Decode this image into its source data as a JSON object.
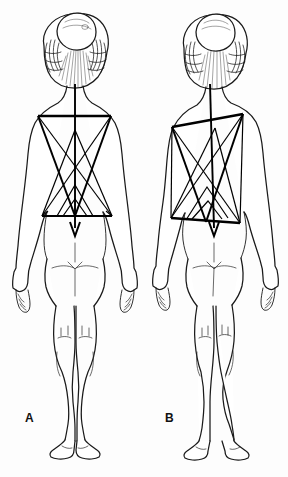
{
  "figure": {
    "background_color": "#fdfdfd",
    "ink_color": "#1a1a1a",
    "overlay_color": "#000000",
    "width": 288,
    "height": 477
  },
  "panels": [
    {
      "id": "A",
      "label": "A",
      "label_x": 25,
      "label_y": 411,
      "description": "Posterior view of female figure with symmetric postural grid overlay",
      "posture": "balanced",
      "figure_center_x": 75,
      "overlay": {
        "type": "symmetric",
        "shoulder_line": {
          "x1": 38,
          "y1": 116,
          "x2": 111,
          "y2": 116
        },
        "pelvic_line": {
          "x1": 42,
          "y1": 216,
          "x2": 112,
          "y2": 216
        },
        "plumb_line": {
          "x1": 75,
          "y1": 84,
          "x2": 75,
          "y2": 243
        },
        "upper_triangle": [
          [
            38,
            116
          ],
          [
            111,
            116
          ],
          [
            75,
            216
          ]
        ],
        "lower_triangle": [
          [
            42,
            216
          ],
          [
            112,
            216
          ],
          [
            75,
            116
          ]
        ],
        "diagonals": [
          {
            "x1": 38,
            "y1": 116,
            "x2": 112,
            "y2": 216
          },
          {
            "x1": 111,
            "y1": 116,
            "x2": 42,
            "y2": 216
          }
        ],
        "inner_chevrons": [
          [
            [
              57,
              216
            ],
            [
              75,
              185
            ],
            [
              93,
              216
            ]
          ],
          [
            [
              63,
              216
            ],
            [
              75,
              199
            ],
            [
              87,
              216
            ]
          ]
        ]
      }
    },
    {
      "id": "B",
      "label": "B",
      "label_x": 165,
      "label_y": 411,
      "description": "Posterior view of female figure with tilted asymmetric postural grid overlay indicating lateral deviation",
      "posture": "asymmetric",
      "figure_center_x": 215,
      "overlay": {
        "type": "asymmetric-tilted",
        "shoulder_line": {
          "x1": 172,
          "y1": 127,
          "x2": 243,
          "y2": 114
        },
        "pelvic_line": {
          "x1": 171,
          "y1": 218,
          "x2": 240,
          "y2": 223
        },
        "plumb_line": {
          "x1": 210,
          "y1": 84,
          "x2": 214,
          "y2": 243
        },
        "upper_triangle": [
          [
            172,
            127
          ],
          [
            243,
            114
          ],
          [
            206,
            222
          ]
        ],
        "lower_triangle": [
          [
            171,
            218
          ],
          [
            240,
            223
          ],
          [
            215,
            120
          ]
        ],
        "diagonals": [
          {
            "x1": 172,
            "y1": 127,
            "x2": 240,
            "y2": 223
          },
          {
            "x1": 243,
            "y1": 114,
            "x2": 171,
            "y2": 218
          }
        ],
        "inner_chevrons": [
          [
            [
              186,
              220
            ],
            [
              207,
              187
            ],
            [
              228,
              218
            ]
          ],
          [
            [
              192,
              219
            ],
            [
              208,
              201
            ],
            [
              222,
              219
            ]
          ]
        ]
      }
    }
  ],
  "annotations": {
    "figure_type": "anatomical line drawing",
    "view": "posterior",
    "subject": "female",
    "count": 2
  }
}
